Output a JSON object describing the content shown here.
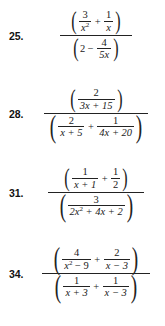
{
  "document": {
    "type": "math-worksheet",
    "topic": "complex-fractions",
    "background_color": "#ffffff",
    "text_color": "#1a1a1a"
  },
  "problems": [
    {
      "number": "25.",
      "numerator": {
        "terms": [
          {
            "num": "3",
            "den": "x²"
          },
          {
            "op": "+"
          },
          {
            "num": "1",
            "den": "x"
          }
        ],
        "text": "(3/x² + 1/x)"
      },
      "denominator": {
        "terms": [
          {
            "whole": "2"
          },
          {
            "op": "−"
          },
          {
            "num": "4",
            "den": "5x"
          }
        ],
        "text": "(2 − 4/5x)"
      },
      "latex": "\\frac{\\left(\\frac{3}{x^2}+\\frac{1}{x}\\right)}{\\left(2-\\frac{4}{5x}\\right)}"
    },
    {
      "number": "28.",
      "numerator": {
        "terms": [
          {
            "num": "2",
            "den": "3x + 15"
          }
        ],
        "text": "(2/(3x + 15))"
      },
      "denominator": {
        "terms": [
          {
            "num": "2",
            "den": "x + 5"
          },
          {
            "op": "+"
          },
          {
            "num": "1",
            "den": "4x + 20"
          }
        ],
        "text": "(2/(x + 5) + 1/(4x + 20))"
      },
      "latex": "\\frac{\\left(\\frac{2}{3x+15}\\right)}{\\left(\\frac{2}{x+5}+\\frac{1}{4x+20}\\right)}"
    },
    {
      "number": "31.",
      "numerator": {
        "terms": [
          {
            "num": "1",
            "den": "x + 1"
          },
          {
            "op": "+"
          },
          {
            "num": "1",
            "den": "2"
          }
        ],
        "text": "(1/(x + 1) + 1/2)"
      },
      "denominator": {
        "terms": [
          {
            "num": "3",
            "den": "2x² + 4x + 2"
          }
        ],
        "text": "(3/(2x² + 4x + 2))"
      },
      "latex": "\\frac{\\left(\\frac{1}{x+1}+\\frac{1}{2}\\right)}{\\left(\\frac{3}{2x^2+4x+2}\\right)}"
    },
    {
      "number": "34.",
      "numerator": {
        "terms": [
          {
            "num": "4",
            "den": "x² − 9"
          },
          {
            "op": "+"
          },
          {
            "num": "2",
            "den": "x − 3"
          }
        ],
        "text": "(4/(x² − 9) + 2/(x − 3))"
      },
      "denominator": {
        "terms": [
          {
            "num": "1",
            "den": "x + 3"
          },
          {
            "op": "+"
          },
          {
            "num": "1",
            "den": "x − 3"
          }
        ],
        "text": "(1/(x + 3) + 1/(x − 3))"
      },
      "latex": "\\frac{\\left(\\frac{4}{x^2-9}+\\frac{2}{x-3}\\right)}{\\left(\\frac{1}{x+3}+\\frac{1}{x-3}\\right)}"
    }
  ],
  "glyphs": {
    "paren_left": "(",
    "paren_right": ")",
    "plus": "+",
    "minus": "−"
  },
  "p25": {
    "number": "25.",
    "n1_num": "3",
    "n1_den_base": "x",
    "n1_den_exp": "2",
    "n_op": "+",
    "n2_num": "1",
    "n2_den": "x",
    "d_whole": "2",
    "d_op": "−",
    "d_num": "4",
    "d_den": "5x"
  },
  "p28": {
    "number": "28.",
    "n_num": "2",
    "n_den": "3x + 15",
    "d1_num": "2",
    "d1_den": "x + 5",
    "d_op": "+",
    "d2_num": "1",
    "d2_den": "4x + 20"
  },
  "p31": {
    "number": "31.",
    "n1_num": "1",
    "n1_den": "x + 1",
    "n_op": "+",
    "n2_num": "1",
    "n2_den": "2",
    "d_num": "3",
    "d_den_base1": "2x",
    "d_den_exp": "2",
    "d_den_rest": " + 4x + 2"
  },
  "p34": {
    "number": "34.",
    "n1_num": "4",
    "n1_den_base": "x",
    "n1_den_exp": "2",
    "n1_den_rest": " − 9",
    "n_op": "+",
    "n2_num": "2",
    "n2_den": "x − 3",
    "d1_num": "1",
    "d1_den": "x + 3",
    "d_op": "+",
    "d2_num": "1",
    "d2_den": "x − 3"
  },
  "top_remnant": "5x"
}
